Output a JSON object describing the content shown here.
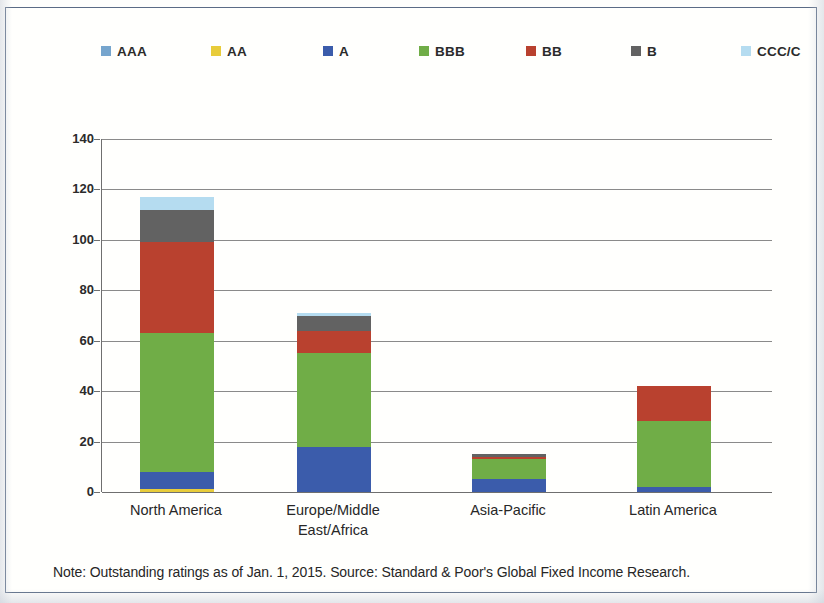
{
  "chart_data": {
    "type": "bar",
    "subtype": "stacked-bar",
    "title": "",
    "subtitle": "",
    "xlabel": "",
    "ylabel": "",
    "ylim": [
      0,
      140
    ],
    "yticks": [
      0,
      20,
      40,
      60,
      80,
      100,
      120,
      140
    ],
    "ytick_labels": [
      "0",
      "20",
      "40",
      "60",
      "80",
      "100",
      "120",
      "140"
    ],
    "grid": true,
    "legend_position": "top",
    "categories": [
      "North America",
      "Europe/Middle East/Africa",
      "Asia-Pacific",
      "Latin America"
    ],
    "category_lines": [
      [
        "North America"
      ],
      [
        "Europe/Middle",
        "East/Africa"
      ],
      [
        "Asia-Pacific"
      ],
      [
        "Latin America"
      ]
    ],
    "series": [
      {
        "name": "AAA",
        "color": "#76a5cd",
        "values": [
          0,
          0,
          0,
          0
        ]
      },
      {
        "name": "AA",
        "color": "#e8cc3a",
        "values": [
          1,
          0,
          0,
          0
        ]
      },
      {
        "name": "A",
        "color": "#3b5cab",
        "values": [
          7,
          18,
          5,
          2
        ]
      },
      {
        "name": "BBB",
        "color": "#70ad47",
        "values": [
          55,
          37,
          8,
          26
        ]
      },
      {
        "name": "BB",
        "color": "#b9412f",
        "values": [
          36,
          9,
          1,
          14
        ]
      },
      {
        "name": "B",
        "color": "#626262",
        "values": [
          13,
          6,
          1,
          0
        ]
      },
      {
        "name": "CCC/C",
        "color": "#b5dcf0",
        "values": [
          5,
          1,
          0,
          0
        ]
      }
    ],
    "totals": [
      117,
      71,
      15,
      42
    ],
    "annotations": [
      "Note: Outstanding ratings as of Jan. 1, 2015. Source: Standard & Poor's Global Fixed Income Research."
    ]
  },
  "legend": {
    "items": [
      {
        "label": "AAA",
        "color": "#76a5cd"
      },
      {
        "label": "AA",
        "color": "#e8cc3a"
      },
      {
        "label": "A",
        "color": "#3b5cab"
      },
      {
        "label": "BBB",
        "color": "#70ad47"
      },
      {
        "label": "BB",
        "color": "#b9412f"
      },
      {
        "label": "B",
        "color": "#626262"
      },
      {
        "label": "CCC/C",
        "color": "#b5dcf0"
      }
    ]
  },
  "note": {
    "text": "Note: Outstanding ratings as of Jan. 1, 2015. Source: Standard & Poor's Global Fixed Income Research."
  },
  "colors": {
    "frame_border": "#5a6b85",
    "gridline": "#8a8a8a",
    "axis": "#6f6f6f",
    "text": "#272727",
    "background": "#fffffd"
  }
}
